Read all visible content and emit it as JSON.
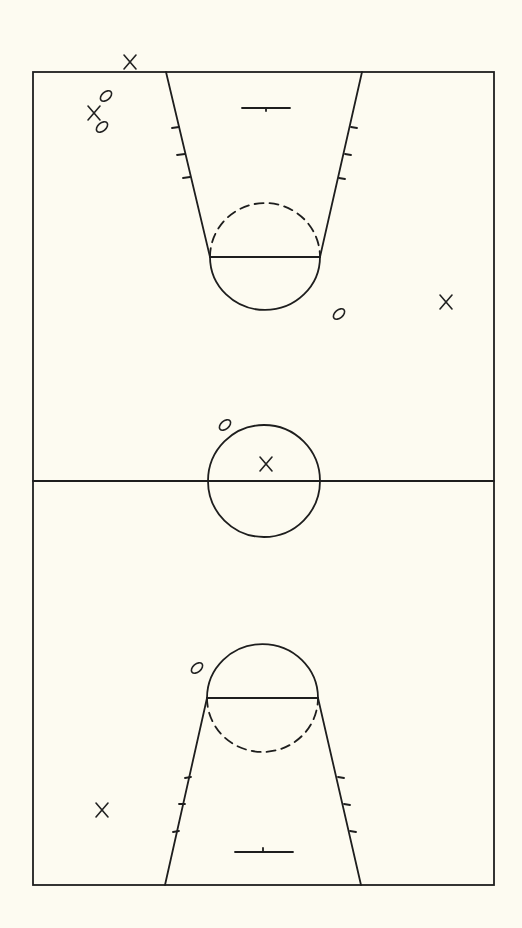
{
  "diagram": {
    "type": "basketball-court-play-diagram",
    "background_color": "#fdfbf1",
    "line_color": "#1e1e1e",
    "court": {
      "left": 33,
      "top": 72,
      "right": 494,
      "bottom": 885,
      "midcourt_y": 481
    },
    "center_circle": {
      "cx": 264,
      "cy": 481,
      "r": 56
    },
    "top_key": {
      "lane_left_top": [
        166,
        72
      ],
      "lane_left_bottom": [
        210,
        257
      ],
      "lane_right_top": [
        362,
        72
      ],
      "lane_right_bottom": [
        320,
        257
      ],
      "free_throw_line_y": 257,
      "free_throw_circle": {
        "cx": 265,
        "cy": 257,
        "r": 55
      },
      "backboard": {
        "x1": 242,
        "x2": 290,
        "y": 108
      }
    },
    "bottom_key": {
      "lane_left_top": [
        207,
        698
      ],
      "lane_left_bottom": [
        165,
        885
      ],
      "lane_right_top": [
        318,
        698
      ],
      "lane_right_bottom": [
        361,
        885
      ],
      "free_throw_line_y": 698,
      "free_throw_circle": {
        "cx": 262,
        "cy": 698,
        "r": 55
      },
      "backboard": {
        "x1": 235,
        "x2": 293,
        "y": 852
      }
    },
    "legend": {
      "offense_symbol": "X",
      "defense_symbol": "O"
    },
    "players": [
      {
        "symbol": "X",
        "team": "offense",
        "x": 130,
        "y": 62
      },
      {
        "symbol": "X",
        "team": "offense",
        "x": 94,
        "y": 113
      },
      {
        "symbol": "O",
        "team": "defense",
        "x": 106,
        "y": 96
      },
      {
        "symbol": "O",
        "team": "defense",
        "x": 102,
        "y": 127
      },
      {
        "symbol": "O",
        "team": "defense",
        "x": 339,
        "y": 314
      },
      {
        "symbol": "X",
        "team": "offense",
        "x": 446,
        "y": 302
      },
      {
        "symbol": "O",
        "team": "defense",
        "x": 225,
        "y": 425
      },
      {
        "symbol": "X",
        "team": "offense",
        "x": 266,
        "y": 464
      },
      {
        "symbol": "O",
        "team": "defense",
        "x": 197,
        "y": 668
      },
      {
        "symbol": "X",
        "team": "offense",
        "x": 102,
        "y": 810
      }
    ]
  }
}
